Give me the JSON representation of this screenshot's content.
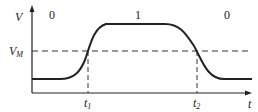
{
  "diagram": {
    "y_axis_label": "V",
    "x_axis_label": "t",
    "threshold_label": "V",
    "threshold_sub": "M",
    "regions": [
      "0",
      "1",
      "0"
    ],
    "t1_label": "t",
    "t1_sub": "1",
    "t2_label": "t",
    "t2_sub": "2"
  }
}
